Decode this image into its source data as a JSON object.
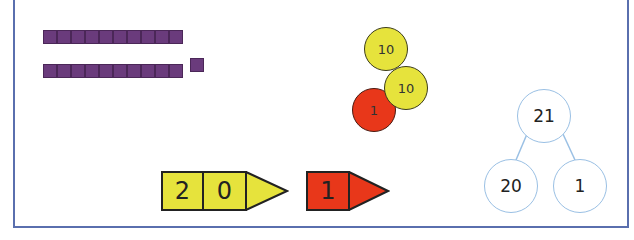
{
  "base_ten_blocks": {
    "tens_rods": 2,
    "ones_cubes": 1,
    "color": "#6a3b7c"
  },
  "counters": [
    {
      "value": "10",
      "color": "yellow"
    },
    {
      "value": "10",
      "color": "yellow"
    },
    {
      "value": "1",
      "color": "red"
    }
  ],
  "place_value_cards": {
    "tens": {
      "digits": [
        "2",
        "0"
      ],
      "color": "#e6e33c"
    },
    "ones": {
      "digits": [
        "1"
      ],
      "color": "#e8371a"
    }
  },
  "part_whole": {
    "whole": "21",
    "parts": [
      "20",
      "1"
    ],
    "line_color": "#9ac0e4"
  },
  "colors": {
    "frame": "#5a6fae",
    "yellow": "#e6e33c",
    "red": "#e8371a"
  }
}
